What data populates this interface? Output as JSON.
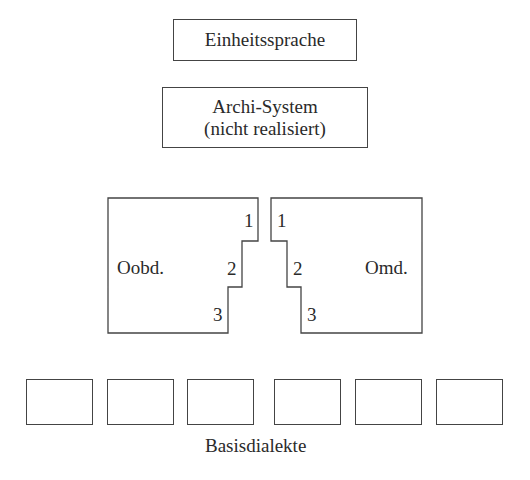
{
  "top_box": {
    "label": "Einheitssprache"
  },
  "archi_box": {
    "line1": "Archi-System",
    "line2": "(nicht realisiert)"
  },
  "left_region": {
    "label": "Oobd.",
    "steps": [
      "1",
      "2",
      "3"
    ]
  },
  "right_region": {
    "label": "Omd.",
    "steps": [
      "1",
      "2",
      "3"
    ]
  },
  "base_dialects": {
    "label": "Basisdialekte",
    "count": 6
  }
}
